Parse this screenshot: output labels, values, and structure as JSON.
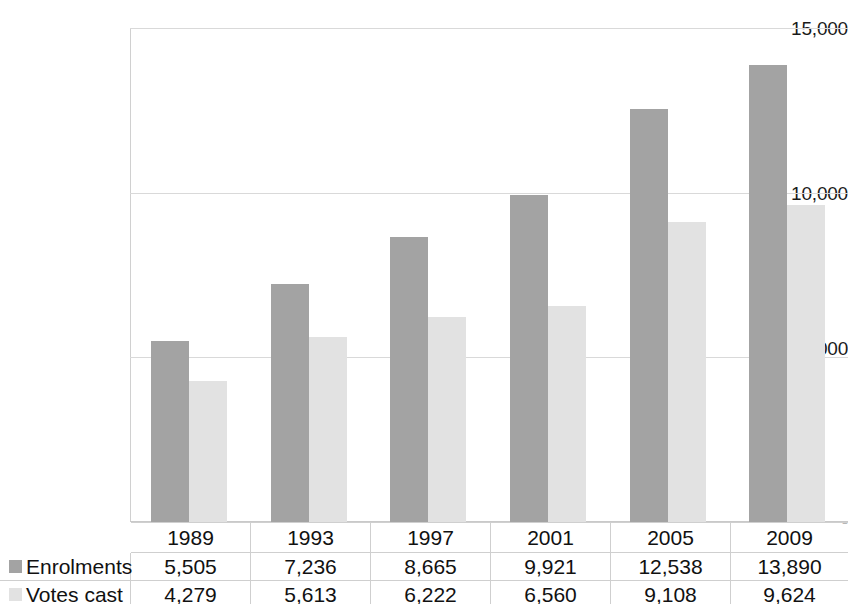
{
  "chart_data": {
    "type": "bar",
    "title": "",
    "xlabel": "",
    "ylabel": "",
    "categories": [
      "1989",
      "1993",
      "1997",
      "2001",
      "2005",
      "2009"
    ],
    "series": [
      {
        "name": "Enrolments",
        "color": "#a3a3a3",
        "values": [
          5505,
          7236,
          8665,
          9921,
          12538,
          13890
        ],
        "labels": [
          "5,505",
          "7,236",
          "8,665",
          "9,921",
          "12,538",
          "13,890"
        ]
      },
      {
        "name": "Votes cast",
        "color": "#e2e2e2",
        "values": [
          4279,
          5613,
          6222,
          6560,
          9108,
          9624
        ],
        "labels": [
          "4,279",
          "5,613",
          "6,222",
          "6,560",
          "9,108",
          "9,624"
        ]
      }
    ],
    "ylim": [
      0,
      15000
    ],
    "y_ticks": [
      0,
      5000,
      10000,
      15000
    ],
    "y_tick_labels": [
      "-",
      "5,000",
      "10,000",
      "15,000"
    ],
    "grid": true,
    "legend_position": "table-left",
    "data_table_visible": true
  },
  "axis": {
    "tick_15000": "15,000",
    "tick_10000": "10,000",
    "tick_5000": "5,000",
    "tick_0": "-"
  },
  "table": {
    "year_headers": [
      "1989",
      "1993",
      "1997",
      "2001",
      "2005",
      "2009"
    ],
    "rows": [
      {
        "label": "Enrolments",
        "values": [
          "5,505",
          "7,236",
          "8,665",
          "9,921",
          "12,538",
          "13,890"
        ]
      },
      {
        "label": "Votes cast",
        "values": [
          "4,279",
          "5,613",
          "6,222",
          "6,560",
          "9,108",
          "9,624"
        ]
      }
    ]
  }
}
